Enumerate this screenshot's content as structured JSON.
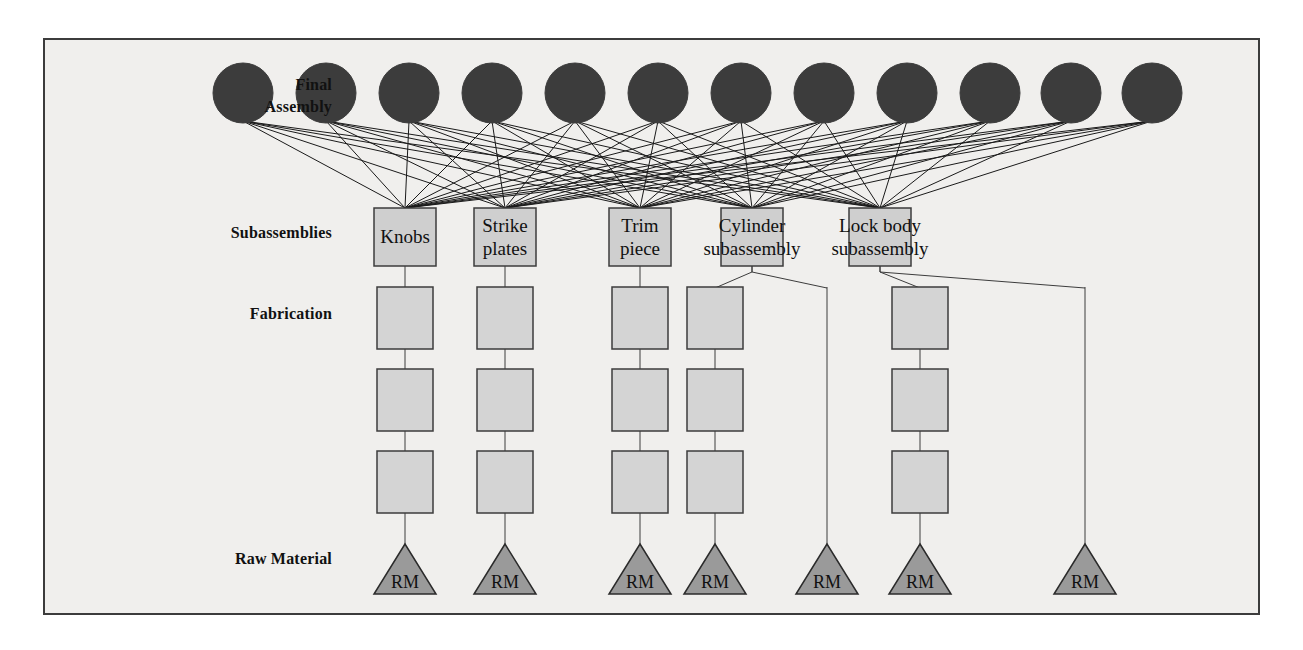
{
  "diagram": {
    "background_color": "#f0efed",
    "frame_border_color": "#3c3c3c",
    "node_colors": {
      "final_assembly_circle": "#3c3c3c",
      "subassembly_box": "#cfcfcf",
      "fabrication_box": "#d4d4d4",
      "raw_material_triangle": "#9a9a9a",
      "edge_line": "#1a1a1a",
      "box_border": "#3c3c3c"
    },
    "row_labels": [
      {
        "id": "final-assembly",
        "text": "Final\nAssembly",
        "x": 332,
        "y": 74
      },
      {
        "id": "subassemblies",
        "text": "Subassemblies",
        "x": 332,
        "y": 222
      },
      {
        "id": "fabrication",
        "text": "Fabrication",
        "x": 332,
        "y": 303
      },
      {
        "id": "raw-material",
        "text": "Raw Material",
        "x": 332,
        "y": 548
      }
    ],
    "final_assembly": {
      "count": 12,
      "radius": 30,
      "cy": 93,
      "centers_x": [
        243,
        326,
        409,
        492,
        575,
        658,
        741,
        824,
        907,
        990,
        1071,
        1152
      ]
    },
    "subassemblies": [
      {
        "id": "knobs",
        "label": "Knobs",
        "cx": 405,
        "cy": 237,
        "w": 62,
        "h": 58,
        "overflow": false
      },
      {
        "id": "strike",
        "label": "Strike\nplates",
        "cx": 505,
        "cy": 237,
        "w": 62,
        "h": 58,
        "overflow": false
      },
      {
        "id": "trim",
        "label": "Trim\npiece",
        "cx": 640,
        "cy": 237,
        "w": 62,
        "h": 58,
        "overflow": false
      },
      {
        "id": "cylinder",
        "label": "Cylinder\nsubassembly",
        "cx": 752,
        "cy": 237,
        "w": 62,
        "h": 58,
        "overflow": true
      },
      {
        "id": "lockbody",
        "label": "Lock body\nsubassembly",
        "cx": 880,
        "cy": 237,
        "w": 62,
        "h": 58,
        "overflow": true
      }
    ],
    "fabrication": {
      "box_w": 56,
      "box_h": 62,
      "levels_cy": [
        318,
        400,
        482
      ],
      "columns_x": [
        405,
        505,
        640,
        715,
        920
      ]
    },
    "fabrication_branch_lines": [
      {
        "from_cx": 752,
        "to_cx": 715
      },
      {
        "from_cx": 752,
        "to_cx": 827
      },
      {
        "from_cx": 880,
        "to_cx": 920
      },
      {
        "from_cx": 880,
        "to_cx": 1085
      }
    ],
    "raw_material": {
      "label": "RM",
      "count": 7,
      "width": 62,
      "height": 50,
      "base_y": 594,
      "centers_x": [
        405,
        505,
        640,
        715,
        827,
        920,
        1085
      ]
    },
    "direct_drop_columns_x": [
      827,
      1085
    ],
    "edges_note": "Every final assembly circle connects to every subassembly box (12 x 5 = 60 edges)."
  }
}
